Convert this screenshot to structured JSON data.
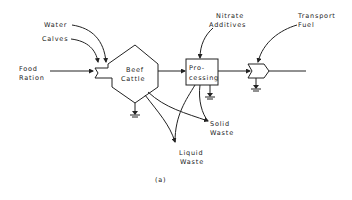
{
  "diagram": {
    "caption": "(a)",
    "inputs": {
      "water": "Water",
      "calves": "Calves",
      "food_ration_line1": "Food",
      "food_ration_line2": "Ration",
      "nitrate_line1": "Nitrate",
      "nitrate_line2": "Additives",
      "transport_line1": "Transport",
      "transport_line2": "Fuel"
    },
    "nodes": {
      "beef_cattle_line1": "Beef",
      "beef_cattle_line2": "Cattle",
      "processing_line1": "Pro-",
      "processing_line2": "cessing"
    },
    "outputs": {
      "solid_waste_line1": "Solid",
      "solid_waste_line2": "Waste",
      "liquid_waste_line1": "Liquid",
      "liquid_waste_line2": "Waste"
    }
  }
}
